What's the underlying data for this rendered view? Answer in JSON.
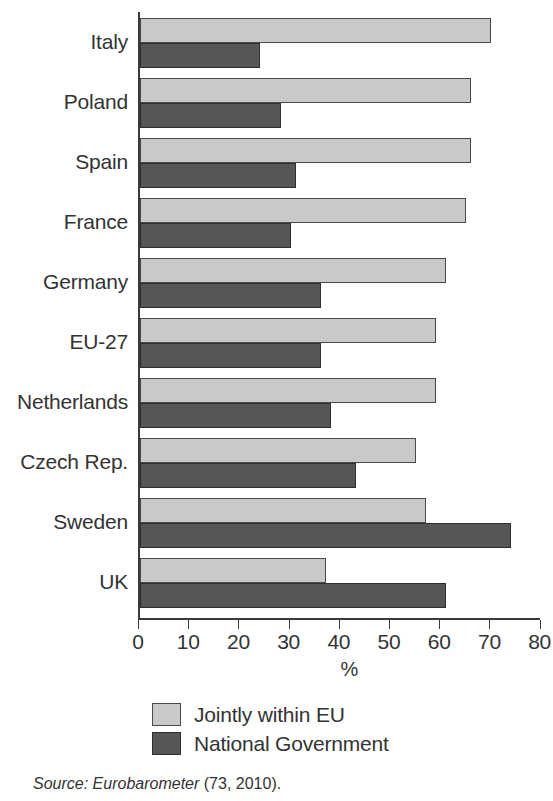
{
  "chart_data": {
    "type": "bar",
    "orientation": "horizontal",
    "title": "",
    "subtitle": "",
    "xlabel": "%",
    "ylabel": "",
    "xlim": [
      0,
      80
    ],
    "xticks": [
      0,
      10,
      20,
      30,
      40,
      50,
      60,
      70,
      80
    ],
    "xtick_labels": [
      "0",
      "10",
      "20",
      "30",
      "40",
      "50",
      "60",
      "70",
      "80"
    ],
    "grid": false,
    "legend_position": "bottom",
    "categories": [
      "Italy",
      "Poland",
      "Spain",
      "France",
      "Germany",
      "EU-27",
      "Netherlands",
      "Czech Rep.",
      "Sweden",
      "UK"
    ],
    "series": [
      {
        "name": "Jointly within EU",
        "color": "#c9c9c9",
        "values": [
          70,
          66,
          66,
          65,
          61,
          59,
          59,
          55,
          57,
          37
        ]
      },
      {
        "name": "National Government",
        "color": "#565656",
        "values": [
          24,
          28,
          31,
          30,
          36,
          36,
          38,
          43,
          74,
          61
        ]
      }
    ]
  },
  "legend": {
    "items": [
      {
        "label": "Jointly within EU",
        "swatch": "light"
      },
      {
        "label": "National Government",
        "swatch": "dark"
      }
    ]
  },
  "source": {
    "prefix": "Source:",
    "publication": "Eurobarometer",
    "reference": "(73, 2010)."
  }
}
